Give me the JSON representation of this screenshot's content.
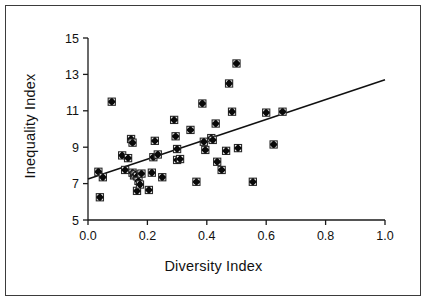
{
  "chart_data": {
    "type": "scatter",
    "title": "",
    "xlabel": "Diversity Index",
    "ylabel": "Inequality Index",
    "xlim": [
      0.0,
      1.0
    ],
    "ylim": [
      5,
      15
    ],
    "xticks": [
      "0.0",
      "0.2",
      "0.4",
      "0.6",
      "0.8",
      "1.0"
    ],
    "xtick_values": [
      0.0,
      0.2,
      0.4,
      0.6,
      0.8,
      1.0
    ],
    "yticks": [
      "5",
      "7",
      "9",
      "11",
      "13",
      "15"
    ],
    "ytick_values": [
      5,
      7,
      9,
      11,
      13,
      15
    ],
    "grid": false,
    "legend": null,
    "marker": "filled-square-with-outline",
    "points": [
      [
        0.035,
        7.65
      ],
      [
        0.04,
        6.25
      ],
      [
        0.05,
        7.35
      ],
      [
        0.08,
        11.5
      ],
      [
        0.115,
        8.55
      ],
      [
        0.125,
        7.75
      ],
      [
        0.135,
        8.4
      ],
      [
        0.145,
        9.45
      ],
      [
        0.15,
        9.25
      ],
      [
        0.15,
        7.6
      ],
      [
        0.155,
        7.45
      ],
      [
        0.16,
        7.5
      ],
      [
        0.165,
        7.4
      ],
      [
        0.165,
        6.6
      ],
      [
        0.17,
        7.15
      ],
      [
        0.175,
        6.95
      ],
      [
        0.18,
        7.55
      ],
      [
        0.205,
        6.65
      ],
      [
        0.215,
        7.6
      ],
      [
        0.22,
        8.45
      ],
      [
        0.225,
        9.35
      ],
      [
        0.235,
        8.6
      ],
      [
        0.25,
        7.35
      ],
      [
        0.29,
        10.5
      ],
      [
        0.295,
        9.6
      ],
      [
        0.3,
        8.9
      ],
      [
        0.3,
        8.3
      ],
      [
        0.31,
        8.35
      ],
      [
        0.345,
        9.95
      ],
      [
        0.365,
        7.1
      ],
      [
        0.385,
        11.4
      ],
      [
        0.39,
        9.3
      ],
      [
        0.395,
        8.85
      ],
      [
        0.415,
        9.5
      ],
      [
        0.42,
        9.4
      ],
      [
        0.43,
        10.3
      ],
      [
        0.435,
        8.2
      ],
      [
        0.45,
        7.75
      ],
      [
        0.465,
        8.8
      ],
      [
        0.475,
        12.5
      ],
      [
        0.485,
        10.95
      ],
      [
        0.5,
        13.6
      ],
      [
        0.505,
        8.95
      ],
      [
        0.555,
        7.1
      ],
      [
        0.6,
        10.9
      ],
      [
        0.625,
        9.15
      ],
      [
        0.655,
        10.95
      ]
    ],
    "trendline": {
      "type": "line",
      "x": [
        0.0,
        1.0
      ],
      "y": [
        7.25,
        12.7
      ]
    }
  }
}
